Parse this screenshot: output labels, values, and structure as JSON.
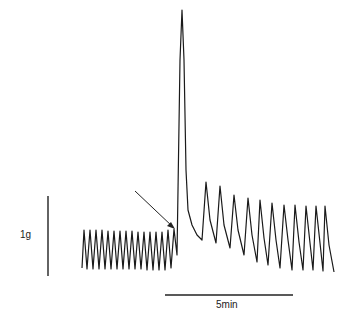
{
  "figure": {
    "y_scale_label": "1g",
    "x_scale_label": "5min",
    "arrow_annotation": "stimulus application point (unlabeled arrow)"
  },
  "chart_data": {
    "type": "line",
    "title": "",
    "xlabel": "",
    "ylabel": "",
    "grid": false,
    "legend": null,
    "scale_bars": {
      "vertical": {
        "label": "1g",
        "length_px": 80
      },
      "horizontal": {
        "label": "5min",
        "length_px": 128
      }
    },
    "series": [
      {
        "name": "force",
        "phases": [
          {
            "phase": "baseline",
            "cycles": 14,
            "peak_amplitude_g": 0.55,
            "duration_min": 3.7
          },
          {
            "phase": "contracture spike",
            "cycles": 1,
            "peak_amplitude_g": 3.3,
            "duration_min": 0.4
          },
          {
            "phase": "post-spike contractions",
            "cycles": 11,
            "peak_amplitude_g": 0.7,
            "duration_min": 5.5
          }
        ]
      }
    ],
    "trace_points": [
      [
        82,
        268
      ],
      [
        84,
        230
      ],
      [
        87,
        269
      ],
      [
        90,
        230
      ],
      [
        93,
        269
      ],
      [
        96,
        230
      ],
      [
        99,
        269
      ],
      [
        102,
        230
      ],
      [
        105,
        269
      ],
      [
        108,
        231
      ],
      [
        111,
        269
      ],
      [
        114,
        231
      ],
      [
        117,
        269
      ],
      [
        120,
        231
      ],
      [
        123,
        269
      ],
      [
        126,
        231
      ],
      [
        129,
        269
      ],
      [
        132,
        231
      ],
      [
        135,
        269
      ],
      [
        138,
        232
      ],
      [
        141,
        269
      ],
      [
        144,
        232
      ],
      [
        147,
        270
      ],
      [
        150,
        232
      ],
      [
        153,
        270
      ],
      [
        156,
        232
      ],
      [
        159,
        270
      ],
      [
        162,
        232
      ],
      [
        165,
        270
      ],
      [
        168,
        230
      ],
      [
        171,
        268
      ],
      [
        174,
        229
      ],
      [
        177,
        255
      ],
      [
        178,
        190
      ],
      [
        180,
        60
      ],
      [
        182,
        10
      ],
      [
        184,
        60
      ],
      [
        186,
        170
      ],
      [
        188,
        210
      ],
      [
        192,
        225
      ],
      [
        197,
        235
      ],
      [
        202,
        240
      ],
      [
        206,
        182
      ],
      [
        210,
        220
      ],
      [
        216,
        243
      ],
      [
        220,
        186
      ],
      [
        224,
        225
      ],
      [
        230,
        248
      ],
      [
        234,
        195
      ],
      [
        238,
        230
      ],
      [
        244,
        255
      ],
      [
        248,
        198
      ],
      [
        252,
        235
      ],
      [
        257,
        262
      ],
      [
        260,
        200
      ],
      [
        264,
        238
      ],
      [
        268,
        265
      ],
      [
        272,
        203
      ],
      [
        276,
        240
      ],
      [
        280,
        268
      ],
      [
        284,
        205
      ],
      [
        288,
        240
      ],
      [
        292,
        270
      ],
      [
        295,
        205
      ],
      [
        299,
        242
      ],
      [
        303,
        270
      ],
      [
        306,
        206
      ],
      [
        310,
        243
      ],
      [
        313,
        270
      ],
      [
        316,
        206
      ],
      [
        320,
        243
      ],
      [
        323,
        271
      ],
      [
        325,
        206
      ],
      [
        329,
        245
      ],
      [
        334,
        272
      ]
    ]
  }
}
